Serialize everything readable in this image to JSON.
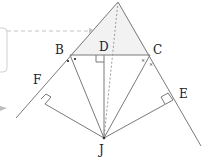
{
  "diagram": {
    "points": {
      "A": {
        "x": 118,
        "y": 2,
        "label": ""
      },
      "B": {
        "x": 70,
        "y": 55,
        "label": "B"
      },
      "C": {
        "x": 150,
        "y": 55,
        "label": "C"
      },
      "D": {
        "x": 104,
        "y": 55,
        "label": "D"
      },
      "E": {
        "x": 173,
        "y": 100,
        "label": "E"
      },
      "F": {
        "x": 45,
        "y": 104,
        "label": "F"
      },
      "J": {
        "x": 104,
        "y": 138,
        "label": "J"
      }
    },
    "labels": {
      "B": "B",
      "C": "C",
      "D": "D",
      "E": "E",
      "F": "F",
      "J": "J"
    },
    "angle_marks": {
      "B": "•",
      "C": "×"
    },
    "colors": {
      "line": "#7a7a7a",
      "dashed": "#a8a8a8",
      "fill": "#f1f1f1",
      "text": "#222222",
      "callout": "#c8c8c8"
    }
  }
}
